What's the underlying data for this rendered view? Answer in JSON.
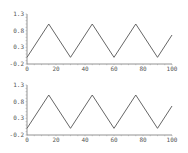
{
  "chart_data": [
    {
      "type": "line",
      "title": "",
      "xlabel": "",
      "ylabel": "",
      "xlim": [
        0,
        100
      ],
      "ylim": [
        -0.2,
        1.3
      ],
      "x_ticks": [
        0,
        20,
        40,
        60,
        80,
        100
      ],
      "x_tick_labels": [
        "0",
        "20",
        "40",
        "60",
        "80",
        "100"
      ],
      "y_ticks": [
        -0.2,
        0.3,
        0.8,
        1.3
      ],
      "y_tick_labels": [
        "-0.2",
        "0.3",
        "0.8",
        "1.3"
      ],
      "grid": false,
      "series": [
        {
          "name": "triangle-wave",
          "color": "#555555",
          "x": [
            0,
            15,
            30,
            45,
            60,
            75,
            90,
            100
          ],
          "y": [
            0,
            1,
            0,
            1,
            0,
            1,
            0,
            0.67
          ]
        }
      ],
      "layout": {
        "top": 14,
        "bottom": 64
      }
    },
    {
      "type": "line",
      "title": "",
      "xlabel": "",
      "ylabel": "",
      "xlim": [
        0,
        100
      ],
      "ylim": [
        -0.2,
        1.3
      ],
      "x_ticks": [
        0,
        20,
        40,
        60,
        80,
        100
      ],
      "x_tick_labels": [
        "0",
        "20",
        "40",
        "60",
        "80",
        "100"
      ],
      "y_ticks": [
        -0.2,
        0.3,
        0.8,
        1.3
      ],
      "y_tick_labels": [
        "-0.2",
        "0.3",
        "0.8",
        "1.3"
      ],
      "grid": false,
      "series": [
        {
          "name": "triangle-wave",
          "color": "#555555",
          "x": [
            0,
            15,
            30,
            45,
            60,
            75,
            90,
            100
          ],
          "y": [
            0,
            1,
            0,
            1,
            0,
            1,
            0,
            0.67
          ]
        }
      ],
      "layout": {
        "top": 85,
        "bottom": 135
      }
    }
  ]
}
